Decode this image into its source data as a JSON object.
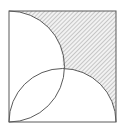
{
  "diagram": {
    "type": "geometry",
    "square": {
      "x": 9,
      "y": 11,
      "side": 107
    },
    "semicircles": [
      {
        "name": "left-semicircle",
        "diameter_edge": "left",
        "bulge": "right"
      },
      {
        "name": "bottom-semicircle",
        "diameter_edge": "bottom",
        "bulge": "up"
      }
    ],
    "shaded_region": "upper-right area outside both semicircles",
    "colors": {
      "stroke": "#5a5a5a",
      "hatch": "#9a9a9a",
      "hatch_bg": "#f2f2f2",
      "background": "#ffffff"
    },
    "labels": []
  }
}
